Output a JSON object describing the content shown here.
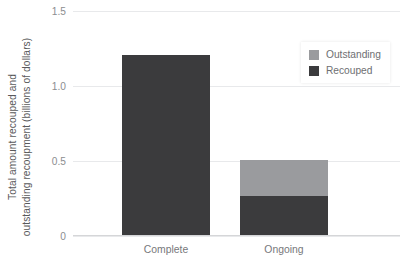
{
  "chart_data": {
    "type": "bar",
    "subtype": "stacked-bar",
    "title": "",
    "xlabel": "",
    "ylabel": "Total amount recouped and outstanding recoupment (billions of dollars)",
    "ylabel_lines": [
      "Total amount recouped and",
      "outstanding recoupment (billions of dollars)"
    ],
    "categories": [
      "Complete",
      "Ongoing"
    ],
    "series": [
      {
        "name": "Recouped",
        "values": [
          1.2,
          0.26
        ],
        "color": "#3b3b3d"
      },
      {
        "name": "Outstanding",
        "values": [
          0.0,
          0.24
        ],
        "color": "#9a9b9e"
      }
    ],
    "stack_order_bottom_to_top": [
      "Recouped",
      "Outstanding"
    ],
    "ylim": [
      0,
      1.5
    ],
    "yticks": [
      0,
      0.5,
      1.0,
      1.5
    ],
    "ytick_labels": [
      "0",
      "0.5",
      "1.0",
      "1.5"
    ],
    "grid": true,
    "grid_axis": "y",
    "legend_position": "top-right",
    "legend_entries": [
      {
        "label": "Outstanding",
        "color": "#9a9b9e"
      },
      {
        "label": "Recouped",
        "color": "#3b3b3d"
      }
    ],
    "totals": [
      1.2,
      0.5
    ],
    "background_color": "#ffffff",
    "gridline_color": "#e8e9eb",
    "axis_color": "#d5d6d8",
    "tick_text_color": "#8c8d90",
    "category_text_color": "#77787b",
    "ylabel_text_color": "#59595b"
  }
}
